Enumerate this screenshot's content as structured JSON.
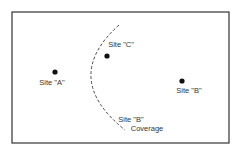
{
  "diagram": {
    "frame": {
      "x": 12,
      "y": 12,
      "width": 217,
      "height": 131,
      "stroke": "#333333"
    },
    "sites": [
      {
        "id": "A",
        "label": "Site \"A\"",
        "dot": {
          "x": 55,
          "y": 72
        },
        "label_pos": {
          "x": 52,
          "y": 85
        }
      },
      {
        "id": "C",
        "label": "Site \"C\"",
        "dot": {
          "x": 107,
          "y": 56
        },
        "label_pos": {
          "x": 121,
          "y": 47
        }
      },
      {
        "id": "B",
        "label": "Site \"B\"",
        "dot": {
          "x": 182,
          "y": 81
        },
        "label_pos": {
          "x": 189,
          "y": 93
        }
      }
    ],
    "coverage": {
      "label_line1": "Site \"B\"",
      "label_line2": "Coverage",
      "line1_pos": {
        "x": 131,
        "y": 122
      },
      "line2_pos": {
        "x": 147,
        "y": 131
      },
      "curve": "M119,25 Q60,78 125,130"
    },
    "colors": {
      "ink": "#222222",
      "text": "#333333",
      "background": "#ffffff"
    }
  }
}
